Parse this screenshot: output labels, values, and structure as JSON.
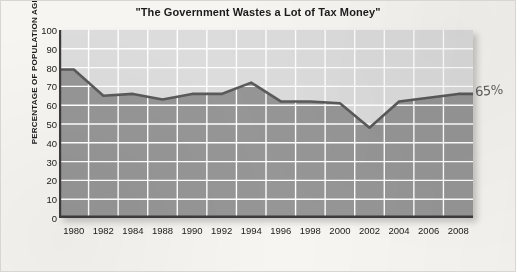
{
  "chart_data": {
    "type": "area",
    "title": "\"The Government Wastes a Lot of Tax Money\"",
    "xlabel": "",
    "ylabel": "PERCENTAGE OF POPULATION AGREEING",
    "ylim": [
      0,
      100
    ],
    "ytick_step": 10,
    "yticks": [
      100,
      90,
      80,
      70,
      60,
      50,
      40,
      30,
      20,
      10,
      0
    ],
    "categories": [
      "1980",
      "1982",
      "1984",
      "1988",
      "1990",
      "1992",
      "1994",
      "1996",
      "1998",
      "2000",
      "2002",
      "2004",
      "2006",
      "2008"
    ],
    "values": [
      79,
      65,
      66,
      63,
      66,
      66,
      72,
      62,
      62,
      61,
      48,
      62,
      64,
      66
    ],
    "series": [
      {
        "name": "Percentage agreeing",
        "values": [
          79,
          65,
          66,
          63,
          66,
          66,
          72,
          62,
          62,
          61,
          48,
          62,
          64,
          66
        ]
      }
    ],
    "grid": "white gridlines, horizontal every 10 and vertical at each year tick",
    "legend": "none",
    "fill_above_color": "#dcdcdc",
    "fill_below_color": "#969696",
    "line_color": "#5a5a5a",
    "annotations": [
      {
        "text": "65%",
        "note": "handwritten annotation at right edge near the 2008 end point",
        "value": 65
      }
    ]
  },
  "colors": {
    "page_background": "#f6f5f1",
    "plot_above": "#dcdcdc",
    "plot_below": "#969696",
    "gridline": "#ffffff",
    "line": "#5a5a5a",
    "axis": "#3c3c3c",
    "text": "#1b1b1b",
    "annotation": "#3b3b3b"
  }
}
